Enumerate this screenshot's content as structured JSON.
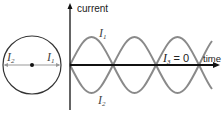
{
  "diagram": {
    "circle": {
      "left_label": "I",
      "left_sub": "2",
      "right_label": "I",
      "right_sub": "1"
    },
    "axes": {
      "y_label": "current",
      "x_label": "time"
    },
    "waves": {
      "upper_label": "I",
      "upper_sub": "1",
      "lower_label": "I",
      "lower_sub": "2",
      "flat_label": "I",
      "flat_sub": "3",
      "flat_value": " = 0"
    },
    "colors": {
      "wave": "#808080",
      "axis": "#111111",
      "circle": "#333333"
    }
  }
}
